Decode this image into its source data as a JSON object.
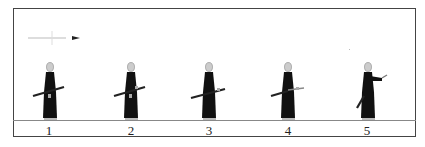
{
  "diagram": {
    "title": "",
    "direction_indicator": {
      "icon": "arrow-right-icon",
      "meaning": "facing direction"
    },
    "steps": [
      {
        "number": "1",
        "pose": "sword at left hip, held across body"
      },
      {
        "number": "2",
        "pose": "right hand on hilt, sword across body"
      },
      {
        "number": "3",
        "pose": "sword drawing begins, right hand forward"
      },
      {
        "number": "4",
        "pose": "sword drawn further, tip lowered behind"
      },
      {
        "number": "5",
        "pose": "right arm extended forward, sword point trailing low"
      }
    ]
  },
  "colors": {
    "frame": "#444444",
    "ground": "#888888",
    "figure": "#111111",
    "head": "#cccccc",
    "text": "#222222"
  }
}
